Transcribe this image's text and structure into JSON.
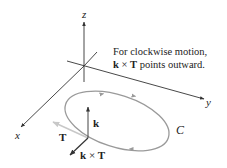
{
  "diagram": {
    "caption_line1": "For clockwise motion,",
    "caption_line2_k": "k",
    "caption_line2_times": " × ",
    "caption_line2_T": "T",
    "caption_line2_rest": " points outward.",
    "axes": {
      "x_label": "x",
      "y_label": "y",
      "z_label": "z"
    },
    "curve_label": "C",
    "vectors": {
      "k_label": "k",
      "T_label": "T",
      "kxT_k": "k",
      "kxT_times": " × ",
      "kxT_T": "T"
    },
    "colors": {
      "axis": "#333333",
      "curve": "#9a9a9a",
      "tangent": "#c8c8c8",
      "text": "#222222"
    }
  }
}
